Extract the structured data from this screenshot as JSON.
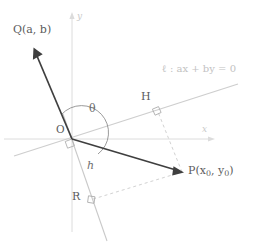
{
  "figure": {
    "background": "#ffffff"
  },
  "axes": {
    "x_label": "x",
    "y_label": "y",
    "axis_color": "#d4d4d4",
    "origin_label": "O"
  },
  "labels": {
    "point_q": "Q(a, b)",
    "point_p_prefix": "P(x",
    "point_p_sub1": "0",
    "point_p_mid": ", y",
    "point_p_sub2": "0",
    "point_p_suffix": ")",
    "point_h": "H",
    "point_r": "R",
    "angle_theta": "θ",
    "distance_h": "h",
    "line_equation": "ℓ :  ax + by = 0"
  },
  "colors": {
    "vector_stroke": "#3a3a3a",
    "line_stroke": "#cccccc",
    "normal_stroke": "#c6c6c6",
    "dashed_stroke": "#cfcfcf",
    "arc_stroke": "#8a8a8a",
    "right_angle_stroke": "#a8a8a8",
    "axis_stroke": "#d9d9d9",
    "text_dark": "#5b5b5b",
    "text_light": "#c2c2c2"
  },
  "geometry": {
    "origin": {
      "x": 72,
      "y": 139
    },
    "point_q": {
      "x": 33,
      "y": 49
    },
    "point_p": {
      "x": 182,
      "y": 172
    },
    "point_h": {
      "x": 155,
      "y": 110
    },
    "point_r": {
      "x": 92,
      "y": 201
    },
    "x_axis": {
      "x1": 4,
      "y1": 139,
      "x2": 214,
      "y2": 139
    },
    "y_axis": {
      "x1": 72,
      "y1": 12,
      "x2": 72,
      "y2": 232
    },
    "line_l": {
      "x1": 14,
      "y1": 156,
      "x2": 236,
      "y2": 85
    },
    "normal_line": {
      "x1": 63,
      "y1": 117,
      "x2": 106,
      "y2": 240
    }
  }
}
